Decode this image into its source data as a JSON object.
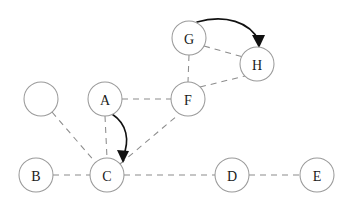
{
  "diagram": {
    "canvas": {
      "width": 347,
      "height": 205,
      "background": "#ffffff"
    },
    "style": {
      "node_radius": 17,
      "node_fill": "#ffffff",
      "node_stroke": "#9a9a9a",
      "dashed_edge_color": "#8c8c8c",
      "dash_pattern": "6 5",
      "arrow_color": "#111111",
      "label_color": "#1a1a1a"
    },
    "nodes": [
      {
        "id": "N0",
        "label": "",
        "cx": 41,
        "cy": 99,
        "r": 17
      },
      {
        "id": "A",
        "label": "A",
        "cx": 105,
        "cy": 99,
        "r": 17
      },
      {
        "id": "B",
        "label": "B",
        "cx": 36,
        "cy": 175,
        "r": 17
      },
      {
        "id": "C",
        "label": "C",
        "cx": 107,
        "cy": 175,
        "r": 17
      },
      {
        "id": "D",
        "label": "D",
        "cx": 232,
        "cy": 175,
        "r": 17
      },
      {
        "id": "E",
        "label": "E",
        "cx": 317,
        "cy": 175,
        "r": 17
      },
      {
        "id": "F",
        "label": "F",
        "cx": 188,
        "cy": 99,
        "r": 17
      },
      {
        "id": "G",
        "label": "G",
        "cx": 189,
        "cy": 38,
        "r": 17
      },
      {
        "id": "H",
        "label": "H",
        "cx": 257,
        "cy": 64,
        "r": 17
      }
    ],
    "dashed_edges": [
      {
        "id": "N0-C",
        "from": "N0",
        "to": "C",
        "x1": 52,
        "y1": 112,
        "x2": 96,
        "y2": 163
      },
      {
        "id": "B-C",
        "from": "B",
        "to": "C",
        "x1": 53,
        "y1": 175,
        "x2": 90,
        "y2": 175
      },
      {
        "id": "A-C",
        "from": "A",
        "to": "C",
        "x1": 105,
        "y1": 116,
        "x2": 107,
        "y2": 158
      },
      {
        "id": "A-F",
        "from": "A",
        "to": "F",
        "x1": 122,
        "y1": 99,
        "x2": 171,
        "y2": 99
      },
      {
        "id": "C-D",
        "from": "C",
        "to": "D",
        "x1": 124,
        "y1": 175,
        "x2": 215,
        "y2": 175
      },
      {
        "id": "D-E",
        "from": "D",
        "to": "E",
        "x1": 249,
        "y1": 175,
        "x2": 300,
        "y2": 175
      },
      {
        "id": "C-F",
        "from": "C",
        "to": "F",
        "x1": 120,
        "y1": 164,
        "x2": 178,
        "y2": 115
      },
      {
        "id": "G-F",
        "from": "G",
        "to": "F",
        "x1": 189,
        "y1": 55,
        "x2": 188,
        "y2": 82
      },
      {
        "id": "G-H",
        "from": "G",
        "to": "H",
        "x1": 204,
        "y1": 46,
        "x2": 243,
        "y2": 57
      },
      {
        "id": "F-H",
        "from": "F",
        "to": "H",
        "x1": 200,
        "y1": 87,
        "x2": 245,
        "y2": 76
      }
    ],
    "arrow_edges": [
      {
        "id": "A-to-C",
        "from": "A",
        "to": "C",
        "directed": true,
        "path": "M 112 114 C 127 124, 130 140, 123 157",
        "head": "M 123 163 L 117 150 L 129 151 Z"
      },
      {
        "id": "G-to-H",
        "from": "G",
        "to": "H",
        "directed": true,
        "path": "M 197 22 C 225 14, 250 22, 259 41",
        "head": "M 259 48 L 252 35 L 265 35 Z"
      }
    ]
  }
}
